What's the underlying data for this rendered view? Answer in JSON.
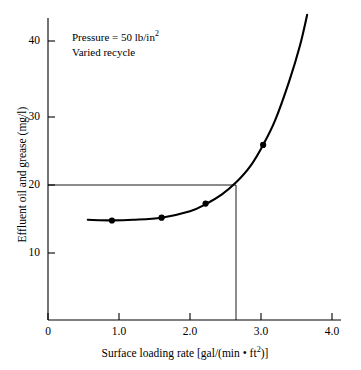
{
  "chart_data": {
    "type": "line",
    "title": "",
    "xlabel": "Surface loading rate [gal/(min • ft²)]",
    "ylabel": "Effluent oil and grease (mg/l)",
    "xlim": [
      0,
      4.0
    ],
    "ylim": [
      0,
      44
    ],
    "xticks": [
      0,
      1.0,
      2.0,
      3.0,
      4.0
    ],
    "xticklabels": [
      "0",
      "1.0",
      "2.0",
      "3.0",
      "4.0"
    ],
    "yticks": [
      10,
      20,
      30,
      40
    ],
    "yticklabels": [
      "10",
      "20",
      "30",
      "40"
    ],
    "grid": false,
    "legend": null,
    "series": [
      {
        "name": "Effluent oil and grease vs surface loading rate",
        "marker": "filled-circle",
        "points": [
          {
            "x": 0.9,
            "y": 14.6
          },
          {
            "x": 1.6,
            "y": 15.0
          },
          {
            "x": 2.22,
            "y": 17.0
          },
          {
            "x": 3.03,
            "y": 25.3
          }
        ],
        "fitted_curve": [
          {
            "x": 0.56,
            "y": 14.7
          },
          {
            "x": 0.9,
            "y": 14.62
          },
          {
            "x": 1.2,
            "y": 14.7
          },
          {
            "x": 1.6,
            "y": 15.0
          },
          {
            "x": 2.0,
            "y": 15.9
          },
          {
            "x": 2.22,
            "y": 16.9
          },
          {
            "x": 2.45,
            "y": 18.3
          },
          {
            "x": 2.65,
            "y": 20.0
          },
          {
            "x": 2.85,
            "y": 22.3
          },
          {
            "x": 3.03,
            "y": 25.3
          },
          {
            "x": 3.2,
            "y": 28.8
          },
          {
            "x": 3.4,
            "y": 34.4
          },
          {
            "x": 3.55,
            "y": 39.4
          },
          {
            "x": 3.65,
            "y": 43.7
          }
        ]
      }
    ],
    "reference_lines": [
      {
        "orientation": "horizontal",
        "value": 20,
        "from_x": 0,
        "to_x": 2.65
      },
      {
        "orientation": "vertical",
        "value": 2.65,
        "from_y": 0,
        "to_y": 20
      }
    ],
    "annotations": [
      {
        "line1": "Pressure = 50 lb/in",
        "line1_sup": "2",
        "line2": "Varied recycle"
      }
    ],
    "colors": {
      "line": "#000000",
      "marker": "#000000",
      "axis": "#000000"
    }
  },
  "annotation": {
    "pressure_text": "Pressure = 50 lb/in",
    "pressure_exponent": "2",
    "recycle_text": "Varied recycle"
  },
  "axes": {
    "x_title_pre": "Surface loading rate [gal/(min • ft",
    "x_title_sup": "2",
    "x_title_post": ")]",
    "y_title": "Effluent oil and grease (mg/l)"
  }
}
